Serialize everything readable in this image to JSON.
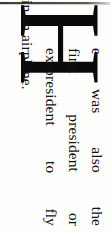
{
  "document": {
    "kind": "scanned-book-page-fragment",
    "orientation_degrees": 90,
    "background_color": "#fdfdfc",
    "ink_color": "#121210",
    "dropcap": {
      "letter": "H",
      "style": "serif-drop-cap",
      "color": "#0a0a0a"
    },
    "paragraph": {
      "full_text": "He was also the first president or ex-president to fly in an airplane.",
      "lines": [
        {
          "text": "e was also the",
          "words": [
            "e",
            "was",
            "also",
            "the"
          ],
          "justified": true
        },
        {
          "text": "first president or",
          "words": [
            "first",
            "president",
            "or"
          ],
          "justified": true
        },
        {
          "text": "ex-president to fly",
          "words": [
            "ex-president",
            "to",
            "fly"
          ],
          "justified": true
        },
        {
          "text": "in an airplane.",
          "words": [
            "in an airplane."
          ],
          "justified": false
        }
      ]
    },
    "scan_edge": {
      "present": true,
      "description": "dark page-edge band along top"
    }
  }
}
